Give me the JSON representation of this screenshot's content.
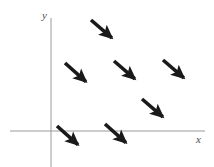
{
  "figure": {
    "name": "direction-field-plot",
    "background_color": "#ffffff",
    "width": 214,
    "height": 167
  },
  "axes": {
    "color": "#9a9a9a",
    "stroke_width": 1,
    "x_axis": {
      "label": "x",
      "y_pixel": 131,
      "x_start": 10,
      "x_end": 205,
      "label_x": 196,
      "label_y": 134
    },
    "y_axis": {
      "label": "y",
      "x_pixel": 51,
      "y_start": 18,
      "y_end": 167,
      "label_x": 42,
      "label_y": 10
    },
    "origin": {
      "x": 51,
      "y": 131
    }
  },
  "chart_data": {
    "type": "scatter",
    "subtype": "direction-field",
    "title": "",
    "xlabel": "x",
    "ylabel": "y",
    "grid": false,
    "legend": null,
    "arrow_color": "#1a1a1a",
    "arrows": [
      {
        "id": "arrow-1",
        "x1": 91,
        "y1": 20,
        "x2": 119,
        "y2": 44,
        "angle_deg": -40.6
      },
      {
        "id": "arrow-2",
        "x1": 65,
        "y1": 63,
        "x2": 93,
        "y2": 88,
        "angle_deg": -41.8
      },
      {
        "id": "arrow-3",
        "x1": 114,
        "y1": 61,
        "x2": 142,
        "y2": 85,
        "angle_deg": -40.6
      },
      {
        "id": "arrow-4",
        "x1": 163,
        "y1": 60,
        "x2": 191,
        "y2": 84,
        "angle_deg": -40.6
      },
      {
        "id": "arrow-5",
        "x1": 142,
        "y1": 99,
        "x2": 170,
        "y2": 123,
        "angle_deg": -40.6
      },
      {
        "id": "arrow-6",
        "x1": 57,
        "y1": 126,
        "x2": 85,
        "y2": 151,
        "angle_deg": -41.8
      },
      {
        "id": "arrow-7",
        "x1": 105,
        "y1": 124,
        "x2": 133,
        "y2": 149,
        "angle_deg": -41.8
      }
    ],
    "arrow_count": 7,
    "common_direction": "down-right",
    "xlim": [
      -1.5,
      7.5
    ],
    "ylim": [
      -1.2,
      6.0
    ]
  }
}
